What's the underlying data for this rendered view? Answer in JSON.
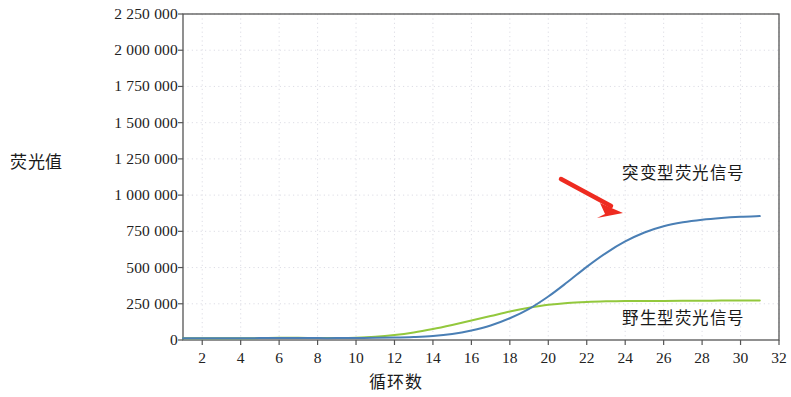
{
  "chart_data": {
    "type": "line",
    "title": "",
    "xlabel": "循环数",
    "ylabel": "荧光值",
    "xlim": [
      1,
      32
    ],
    "ylim": [
      0,
      2250000
    ],
    "grid": true,
    "legend_position": "inline-annotations",
    "x_ticks": [
      2,
      4,
      6,
      8,
      10,
      12,
      14,
      16,
      18,
      20,
      22,
      24,
      26,
      28,
      30,
      32
    ],
    "y_ticks": [
      "0",
      "250 000",
      "500 000",
      "750 000",
      "1 000 000",
      "1 250 000",
      "1 500 000",
      "1 750 000",
      "2 000 000",
      "2 250 000"
    ],
    "y_tick_values": [
      0,
      250000,
      500000,
      750000,
      1000000,
      1250000,
      1500000,
      1750000,
      2000000,
      2250000
    ],
    "x": [
      1,
      2,
      3,
      4,
      5,
      6,
      7,
      8,
      9,
      10,
      11,
      12,
      13,
      14,
      15,
      16,
      17,
      18,
      19,
      20,
      21,
      22,
      23,
      24,
      25,
      26,
      27,
      28,
      29,
      30,
      31
    ],
    "series": [
      {
        "name": "突变型荧光信号",
        "color": "#4a7fb5",
        "values": [
          12000,
          12000,
          12000,
          12000,
          13000,
          14000,
          14000,
          13000,
          13000,
          14000,
          15000,
          17000,
          21000,
          28000,
          42000,
          66000,
          100000,
          150000,
          215000,
          300000,
          400000,
          505000,
          600000,
          680000,
          742000,
          785000,
          812000,
          830000,
          842000,
          850000,
          855000
        ]
      },
      {
        "name": "野生型荧光信号",
        "color": "#93c83d",
        "values": [
          12000,
          12000,
          12000,
          12000,
          13000,
          15000,
          15000,
          14000,
          14000,
          16000,
          22000,
          34000,
          52000,
          76000,
          104000,
          134000,
          165000,
          196000,
          222000,
          243000,
          256000,
          263000,
          267000,
          269000,
          270000,
          270000,
          271000,
          271000,
          272000,
          272000,
          272000
        ]
      }
    ],
    "annotations": [
      {
        "name": "mutant-label",
        "text": "突变型荧光信号"
      },
      {
        "name": "wild-label",
        "text": "野生型荧光信号"
      },
      {
        "name": "red-arrow",
        "color": "#ee2b20"
      }
    ]
  }
}
